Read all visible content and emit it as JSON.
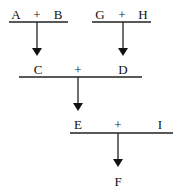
{
  "diagram": {
    "stages": [
      {
        "id": "stage-ab",
        "left": "A",
        "operator": "+",
        "right": "B",
        "output": "C"
      },
      {
        "id": "stage-gh",
        "left": "G",
        "operator": "+",
        "right": "H",
        "output": "D"
      },
      {
        "id": "stage-cd",
        "left": "C",
        "operator": "+",
        "right": "D",
        "output": "E"
      },
      {
        "id": "stage-ei",
        "left": "E",
        "operator": "+",
        "right": "I",
        "output": "F"
      }
    ],
    "final_product": "F"
  }
}
